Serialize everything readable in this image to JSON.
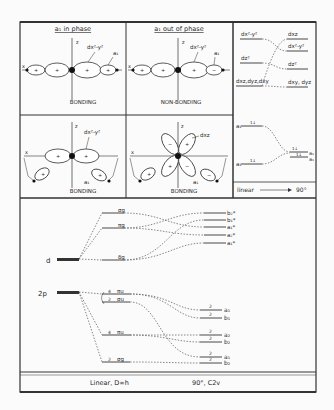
{
  "panels": {
    "top_left": {
      "title": "a₁ in phase",
      "label": "BONDING",
      "d_label": "dx²-y²",
      "a_label": "a₁",
      "axis_x": "x",
      "axis_z": "z",
      "signs": [
        "+",
        "+",
        "+",
        "+"
      ]
    },
    "top_mid": {
      "title": "a₁ out of phase",
      "label": "NON-BONDING",
      "d_label": "dx²-y²",
      "a_label": "a₁",
      "axis_x": "x",
      "axis_z": "z",
      "signs": [
        "+",
        "+",
        "+",
        "−"
      ]
    },
    "bot_left": {
      "label": "BONDING",
      "d_label": "dx²-y²",
      "a_label": "a₁",
      "axis_x": "x",
      "axis_z": "z",
      "signs": [
        "+",
        "+",
        "+",
        "+"
      ]
    },
    "bot_mid": {
      "label": "BONDING",
      "d_label": "dxz",
      "a_label": "a₁",
      "axis_x": "x",
      "axis_z": "z",
      "signs": [
        "−",
        "+",
        "+",
        "−",
        "+",
        "−"
      ]
    },
    "top_right": {
      "left_levels": [
        "dx²-y²",
        "dz²",
        "dxz,dyz,dxy"
      ],
      "right_levels": [
        "dxz",
        "dx²-y²",
        "dz²",
        "dxy, dyz"
      ]
    },
    "mid_right": {
      "left_levels": [
        "a₁",
        "a₁"
      ],
      "right_levels": [
        "a₁",
        "a₁"
      ],
      "electrons": [
        "1↓",
        "1↓",
        "1↓",
        "1↓"
      ],
      "footer": "linear",
      "arrow_to": "90°"
    }
  },
  "mo_diagram": {
    "atomic_d": "d",
    "atomic_2p": "2p",
    "linear_levels": [
      {
        "label": "σg",
        "occ": ""
      },
      {
        "label": "πg",
        "occ": ""
      },
      {
        "label": "δg",
        "occ": ""
      },
      {
        "label": "πu",
        "occ": "4"
      },
      {
        "label": "σu",
        "occ": "2"
      },
      {
        "label": "πu",
        "occ": "4"
      },
      {
        "label": "σg",
        "occ": "2"
      }
    ],
    "bent_levels_upper": [
      "b₂*",
      "b₁*",
      "a₁*",
      "a₂*",
      "a₁*"
    ],
    "bent_levels_lower": [
      {
        "label": "a₁",
        "occ": "2"
      },
      {
        "label": "b₁",
        "occ": "2"
      },
      {
        "label": "a₂",
        "occ": "2"
      },
      {
        "label": "b₂",
        "occ": "2"
      },
      {
        "label": "a₁",
        "occ": "2"
      },
      {
        "label": "b₂",
        "occ": "2"
      }
    ],
    "footer_left": "Linear, D∞h",
    "footer_right": "90°, C2v"
  }
}
